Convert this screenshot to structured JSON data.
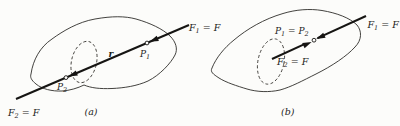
{
  "panel_a": {
    "caption": "(a)",
    "labels": {
      "f1": {
        "sym": "F",
        "sub": "1",
        "rest": " = F"
      },
      "f2": {
        "sym": "F",
        "sub": "2",
        "rest": " = F"
      },
      "p1": {
        "sym": "P",
        "sub": "1"
      },
      "p2": {
        "sym": "P",
        "sub": "2"
      },
      "r": "r"
    }
  },
  "panel_b": {
    "caption": "(b)",
    "labels": {
      "f1": {
        "sym": "F",
        "sub": "1",
        "rest": " = F"
      },
      "f2": {
        "sym": "F",
        "sub": "2",
        "rest": " = F"
      },
      "points": {
        "sym": "P",
        "sub": "1",
        "mid": " = P",
        "sub2": "2"
      }
    }
  },
  "colors": {
    "ink": "#161513",
    "paper": "#fcfcfa"
  }
}
